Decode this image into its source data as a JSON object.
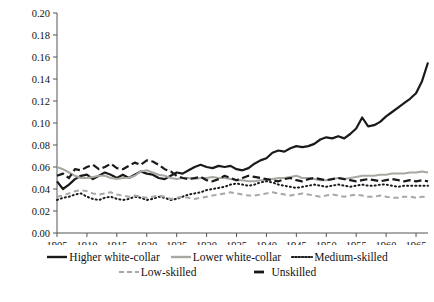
{
  "chart_data": {
    "type": "line",
    "title": "",
    "xlabel": "",
    "ylabel": "",
    "xlim": [
      1905,
      1967
    ],
    "ylim": [
      0.0,
      0.2
    ],
    "grid": false,
    "legend_position": "bottom",
    "ytick_labels": [
      "0.20",
      "0.18",
      "0.16",
      "0.14",
      "0.12",
      "0.10",
      "0.08",
      "0.06",
      "0.04",
      "0.02",
      "0.00"
    ],
    "ytick_values": [
      0.2,
      0.18,
      0.16,
      0.14,
      0.12,
      0.1,
      0.08,
      0.06,
      0.04,
      0.02,
      0.0
    ],
    "xtick_labels": [
      "1905",
      "1910",
      "1915",
      "1920",
      "1925",
      "1930",
      "1935",
      "1940",
      "1945",
      "1950",
      "1955",
      "1960",
      "1965"
    ],
    "xtick_values": [
      1905,
      1910,
      1915,
      1920,
      1925,
      1930,
      1935,
      1940,
      1945,
      1950,
      1955,
      1960,
      1965
    ],
    "x": [
      1905,
      1906,
      1907,
      1908,
      1909,
      1910,
      1911,
      1912,
      1913,
      1914,
      1915,
      1916,
      1917,
      1918,
      1919,
      1920,
      1921,
      1922,
      1923,
      1924,
      1925,
      1926,
      1927,
      1928,
      1929,
      1930,
      1931,
      1932,
      1933,
      1934,
      1935,
      1936,
      1937,
      1938,
      1939,
      1940,
      1941,
      1942,
      1943,
      1944,
      1945,
      1946,
      1947,
      1948,
      1949,
      1950,
      1951,
      1952,
      1953,
      1954,
      1955,
      1956,
      1957,
      1958,
      1959,
      1960,
      1961,
      1962,
      1963,
      1964,
      1965,
      1966,
      1967
    ],
    "series": [
      {
        "name": "Higher white-collar",
        "color": "#1a1a1a",
        "style": "solid",
        "width": 2.2,
        "values": [
          0.047,
          0.04,
          0.044,
          0.049,
          0.052,
          0.053,
          0.049,
          0.052,
          0.055,
          0.053,
          0.05,
          0.053,
          0.05,
          0.053,
          0.056,
          0.054,
          0.053,
          0.05,
          0.049,
          0.052,
          0.055,
          0.054,
          0.057,
          0.06,
          0.062,
          0.06,
          0.059,
          0.061,
          0.06,
          0.061,
          0.058,
          0.057,
          0.059,
          0.063,
          0.066,
          0.068,
          0.073,
          0.075,
          0.074,
          0.077,
          0.079,
          0.078,
          0.079,
          0.081,
          0.085,
          0.087,
          0.086,
          0.088,
          0.086,
          0.09,
          0.095,
          0.105,
          0.097,
          0.098,
          0.101,
          0.106,
          0.11,
          0.114,
          0.118,
          0.122,
          0.127,
          0.138,
          0.155
        ]
      },
      {
        "name": "Lower white-collar",
        "color": "#a8a8a2",
        "style": "solid",
        "width": 2.0,
        "values": [
          0.06,
          0.058,
          0.055,
          0.052,
          0.05,
          0.05,
          0.051,
          0.052,
          0.052,
          0.05,
          0.049,
          0.05,
          0.05,
          0.052,
          0.056,
          0.057,
          0.055,
          0.053,
          0.052,
          0.05,
          0.049,
          0.05,
          0.05,
          0.049,
          0.05,
          0.05,
          0.051,
          0.05,
          0.05,
          0.049,
          0.048,
          0.048,
          0.047,
          0.047,
          0.048,
          0.048,
          0.049,
          0.05,
          0.05,
          0.051,
          0.052,
          0.05,
          0.05,
          0.049,
          0.048,
          0.048,
          0.049,
          0.05,
          0.049,
          0.05,
          0.051,
          0.052,
          0.052,
          0.052,
          0.053,
          0.053,
          0.054,
          0.054,
          0.054,
          0.055,
          0.055,
          0.056,
          0.055
        ]
      },
      {
        "name": "Medium-skilled",
        "color": "#1a1a1a",
        "style": "dotted",
        "width": 2.0,
        "values": [
          0.03,
          0.032,
          0.033,
          0.035,
          0.036,
          0.033,
          0.031,
          0.03,
          0.032,
          0.033,
          0.031,
          0.03,
          0.031,
          0.033,
          0.032,
          0.03,
          0.031,
          0.033,
          0.032,
          0.03,
          0.031,
          0.033,
          0.035,
          0.036,
          0.037,
          0.039,
          0.04,
          0.041,
          0.042,
          0.044,
          0.045,
          0.044,
          0.043,
          0.044,
          0.046,
          0.047,
          0.046,
          0.044,
          0.043,
          0.042,
          0.041,
          0.042,
          0.043,
          0.044,
          0.043,
          0.042,
          0.043,
          0.044,
          0.043,
          0.042,
          0.043,
          0.044,
          0.043,
          0.043,
          0.044,
          0.044,
          0.043,
          0.042,
          0.043,
          0.043,
          0.043,
          0.043,
          0.043
        ]
      },
      {
        "name": "Low-skilled",
        "color": "#a8a8a2",
        "style": "dashed",
        "width": 2.0,
        "values": [
          0.033,
          0.034,
          0.036,
          0.038,
          0.039,
          0.038,
          0.036,
          0.035,
          0.036,
          0.037,
          0.035,
          0.034,
          0.033,
          0.034,
          0.033,
          0.032,
          0.033,
          0.034,
          0.033,
          0.031,
          0.032,
          0.033,
          0.032,
          0.031,
          0.032,
          0.033,
          0.034,
          0.035,
          0.036,
          0.037,
          0.036,
          0.035,
          0.034,
          0.034,
          0.035,
          0.036,
          0.037,
          0.036,
          0.035,
          0.034,
          0.035,
          0.036,
          0.035,
          0.034,
          0.033,
          0.034,
          0.035,
          0.034,
          0.033,
          0.034,
          0.035,
          0.034,
          0.033,
          0.033,
          0.034,
          0.033,
          0.032,
          0.032,
          0.033,
          0.033,
          0.032,
          0.033,
          0.033
        ]
      },
      {
        "name": "Unskilled",
        "color": "#1a1a1a",
        "style": "dashed-long",
        "width": 2.2,
        "values": [
          0.052,
          0.054,
          0.05,
          0.058,
          0.057,
          0.06,
          0.062,
          0.058,
          0.06,
          0.063,
          0.059,
          0.058,
          0.061,
          0.064,
          0.062,
          0.066,
          0.065,
          0.062,
          0.058,
          0.056,
          0.052,
          0.05,
          0.049,
          0.05,
          0.051,
          0.048,
          0.047,
          0.049,
          0.052,
          0.05,
          0.048,
          0.05,
          0.052,
          0.051,
          0.05,
          0.049,
          0.048,
          0.047,
          0.049,
          0.05,
          0.048,
          0.047,
          0.049,
          0.05,
          0.049,
          0.048,
          0.049,
          0.05,
          0.049,
          0.048,
          0.047,
          0.048,
          0.049,
          0.048,
          0.047,
          0.048,
          0.049,
          0.048,
          0.047,
          0.048,
          0.047,
          0.048,
          0.047
        ]
      }
    ]
  },
  "legend": {
    "rows": [
      [
        {
          "label": "Higher white-collar",
          "swatch": "solid-dark"
        },
        {
          "label": "Lower white-collar",
          "swatch": "solid-gray"
        },
        {
          "label": "Medium-skilled",
          "swatch": "dotted-dark"
        }
      ],
      [
        {
          "label": "Low-skilled",
          "swatch": "dashed-gray"
        },
        {
          "label": "Unskilled",
          "swatch": "dash-dark"
        }
      ]
    ]
  }
}
